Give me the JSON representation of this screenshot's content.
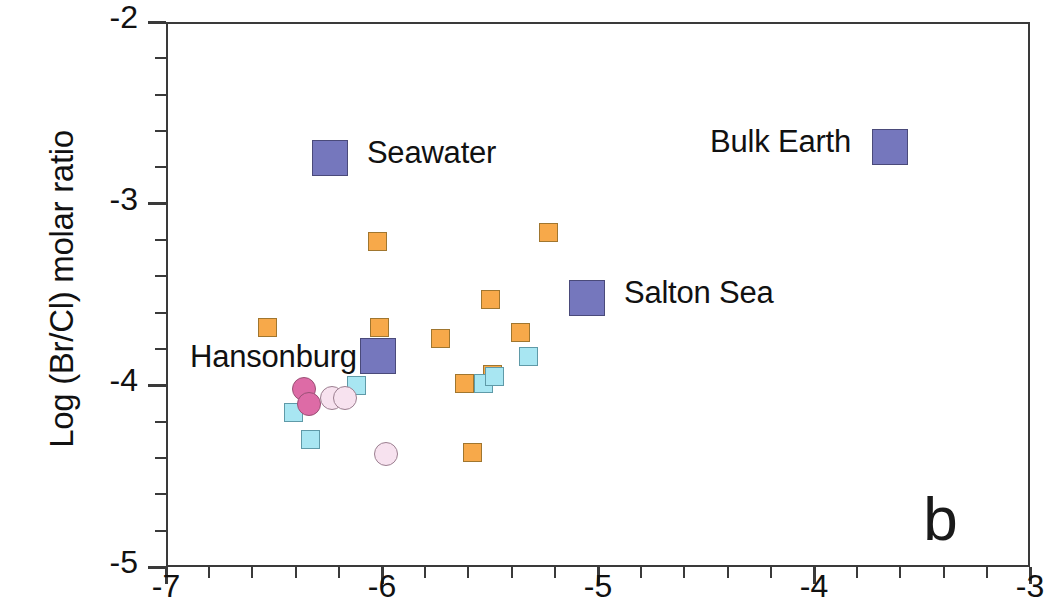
{
  "figure": {
    "panel_letter": "b",
    "background_color": "#ffffff"
  },
  "chart_data": {
    "type": "scatter",
    "title": "",
    "subtitle": "",
    "xlabel": "",
    "ylabel": "Log (Br/Cl) molar ratio",
    "xlim": [
      -7,
      -3
    ],
    "ylim": [
      -5,
      -2
    ],
    "xticks": [
      -7,
      -6,
      -5,
      -4,
      -3
    ],
    "xtick_labels": [
      "-7",
      "-6",
      "-5",
      "-4",
      "-3"
    ],
    "x_minor_tick_interval": 0.2,
    "yticks": [
      -2,
      -3,
      -4,
      -5
    ],
    "ytick_labels": [
      "-2",
      "-3",
      "-4",
      "-5"
    ],
    "y_minor_tick_interval": 0.2,
    "grid": false,
    "legend_position": "in-plot-inline-labels",
    "marker_colors": {
      "orange_square_fill": "#f7a94a",
      "orange_square_edge": "#a0762f",
      "cyan_square_fill": "#a8e6f2",
      "cyan_square_edge": "#5f9aa8",
      "magenta_circle_fill": "#dd6ba6",
      "magenta_circle_edge": "#9a5176",
      "pink_circle_fill": "#f7e2ef",
      "pink_circle_edge": "#9b7f90",
      "purple_square_fill": "#7577bd",
      "purple_square_edge": "#4a4a7a",
      "axis_color": "#3a3a3a"
    },
    "series": [
      {
        "name": "orange squares",
        "marker": "square",
        "fill": "#f7a94a",
        "edge": "#a0762f",
        "points": [
          {
            "x": -6.53,
            "y": -3.68
          },
          {
            "x": -6.02,
            "y": -3.21
          },
          {
            "x": -6.01,
            "y": -3.68
          },
          {
            "x": -5.73,
            "y": -3.74
          },
          {
            "x": -5.62,
            "y": -3.99
          },
          {
            "x": -5.58,
            "y": -4.37
          },
          {
            "x": -5.5,
            "y": -3.53
          },
          {
            "x": -5.49,
            "y": -3.94
          },
          {
            "x": -5.36,
            "y": -3.71
          },
          {
            "x": -5.23,
            "y": -3.16
          }
        ]
      },
      {
        "name": "cyan squares",
        "marker": "square",
        "fill": "#a8e6f2",
        "edge": "#5f9aa8",
        "points": [
          {
            "x": -6.41,
            "y": -4.15
          },
          {
            "x": -6.33,
            "y": -4.3
          },
          {
            "x": -6.12,
            "y": -4.0
          },
          {
            "x": -5.53,
            "y": -3.99
          },
          {
            "x": -5.48,
            "y": -3.95
          },
          {
            "x": -5.32,
            "y": -3.84
          }
        ]
      },
      {
        "name": "magenta circles",
        "marker": "circle",
        "fill": "#dd6ba6",
        "edge": "#9a5176",
        "points": [
          {
            "x": -6.36,
            "y": -4.02
          },
          {
            "x": -6.34,
            "y": -4.1
          }
        ]
      },
      {
        "name": "pale pink circles",
        "marker": "circle",
        "fill": "#f7e2ef",
        "edge": "#9b7f90",
        "points": [
          {
            "x": -6.23,
            "y": -4.07
          },
          {
            "x": -6.17,
            "y": -4.07
          },
          {
            "x": -5.98,
            "y": -4.38
          }
        ]
      },
      {
        "name": "reference end-members",
        "marker": "square",
        "fill": "#7577bd",
        "edge": "#4a4a7a",
        "points": [
          {
            "x": -6.24,
            "y": -2.75,
            "label": "Seawater"
          },
          {
            "x": -5.05,
            "y": -3.52,
            "label": "Salton Sea"
          },
          {
            "x": -3.65,
            "y": -2.69,
            "label": "Bulk Earth"
          },
          {
            "x": -6.02,
            "y": -3.84,
            "label": "Hansonburg"
          }
        ]
      }
    ],
    "annotations": [
      {
        "text": "Seawater",
        "x": -6.07,
        "y": -2.73
      },
      {
        "text": "Salton Sea",
        "x": -4.88,
        "y": -3.5
      },
      {
        "text": "Bulk Earth",
        "x": -4.22,
        "y": -2.67
      },
      {
        "text": "Hansonburg",
        "x": -6.75,
        "y": -3.84
      },
      {
        "text": "b",
        "x": -3.42,
        "y": -4.77
      }
    ]
  }
}
